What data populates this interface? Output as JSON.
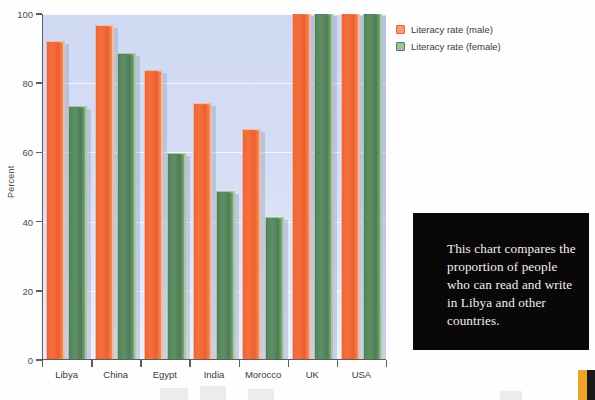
{
  "chart_data": {
    "type": "bar",
    "title": "",
    "xlabel": "",
    "ylabel": "Percent",
    "ylim": [
      0,
      100
    ],
    "yticks": [
      0,
      20,
      40,
      60,
      80,
      100
    ],
    "grid": true,
    "legend_position": "top-right",
    "categories": [
      "Libya",
      "China",
      "Egypt",
      "India",
      "Morocco",
      "UK",
      "USA"
    ],
    "series": [
      {
        "name": "Literacy rate (male)",
        "color": "#f06a37",
        "values": [
          92,
          96.5,
          83.5,
          74,
          66.5,
          100,
          100
        ]
      },
      {
        "name": "Literacy rate (female)",
        "color": "#56855d",
        "values": [
          73,
          88.5,
          59.5,
          48.5,
          41,
          100,
          100
        ]
      }
    ]
  },
  "legend": {
    "items": [
      {
        "label": "Literacy rate (male)",
        "swatch": "male"
      },
      {
        "label": "Literacy rate (female)",
        "swatch": "female"
      }
    ]
  },
  "caption": {
    "text": "This chart compares the proportion of people who can read and write in Libya and other countries."
  },
  "colors": {
    "male": "#f06a37",
    "female": "#56855d",
    "plot_background": "#d6def5",
    "axis": "#5d5d5d",
    "caption_background": "#0a0708",
    "caption_text": "#f3f1ee"
  }
}
